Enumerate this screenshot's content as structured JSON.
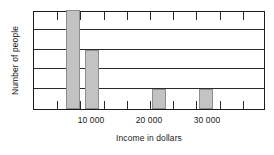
{
  "chart_data": {
    "type": "bar",
    "title": "",
    "xlabel": "Income in dollars",
    "ylabel": "Number of people",
    "grid": true,
    "legend": null,
    "xlim": [
      0,
      40000
    ],
    "ylim": [
      0,
      5
    ],
    "x_tick_interval": 4000,
    "x_tick_labels": [
      {
        "value": 10000,
        "label": "10 000"
      },
      {
        "value": 20000,
        "label": "20 000"
      },
      {
        "value": 30000,
        "label": "30 000"
      }
    ],
    "y_gridline_values": [
      1,
      2,
      3,
      4,
      5
    ],
    "bin_width": 2400,
    "bars": [
      {
        "bin_start": 5600,
        "bin_end": 8000,
        "value": 5
      },
      {
        "bin_start": 8800,
        "bin_end": 11200,
        "value": 3
      },
      {
        "bin_start": 20400,
        "bin_end": 22800,
        "value": 1
      },
      {
        "bin_start": 28400,
        "bin_end": 30800,
        "value": 1
      }
    ],
    "colors": {
      "bar_fill": "#c3c3c3",
      "bar_stroke": "#8e8e8e",
      "axis": "#1c1c1c",
      "grid": "#2b2b2b",
      "text": "#1a1a1a",
      "background": "#ffffff"
    }
  }
}
